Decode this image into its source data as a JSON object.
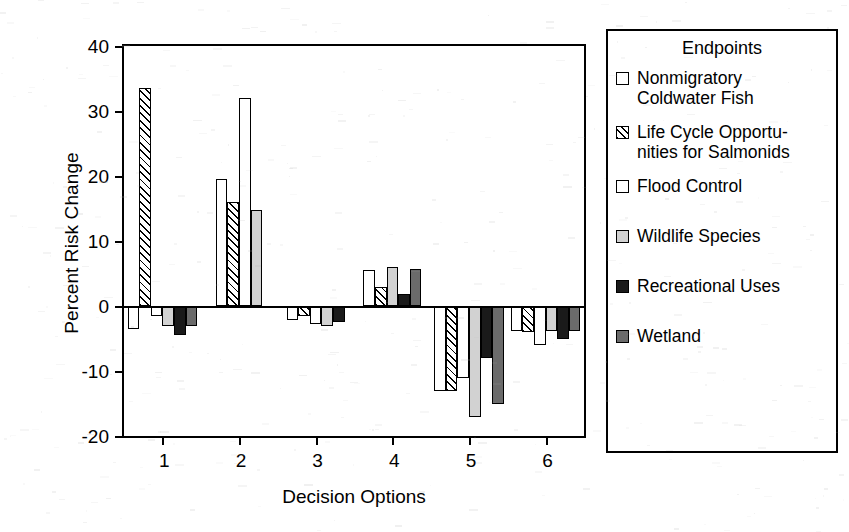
{
  "chart_data": {
    "type": "bar",
    "title": "",
    "xlabel": "Decision Options",
    "ylabel": "Percent Risk Change",
    "categories": [
      "1",
      "2",
      "3",
      "4",
      "5",
      "6"
    ],
    "ylim": [
      -20,
      40
    ],
    "yticks": [
      40,
      30,
      20,
      10,
      0,
      -10,
      -20
    ],
    "ytick_labels": [
      "40",
      "30",
      "20",
      "10",
      "0",
      "-10",
      "-20"
    ],
    "grid": false,
    "legend_position": "right-outside",
    "legend_title": "Endpoints",
    "series": [
      {
        "name": "Nonmigratory Coldwater Fish",
        "label_lines": "Nonmigratory\nColdwater Fish",
        "fill": "white",
        "color": "#ffffff",
        "values": [
          -3.5,
          19.5,
          -2.2,
          5.5,
          -13.0,
          -3.8
        ]
      },
      {
        "name": "Life Cycle Opportunities for Salmonids",
        "label_lines": "Life Cycle Opportu-\nnities for Salmonids",
        "fill": "hatch",
        "color": "#ffffff",
        "values": [
          33.5,
          16.0,
          -1.5,
          3.0,
          -13.0,
          -4.0
        ]
      },
      {
        "name": "Flood Control",
        "label_lines": "Flood Control",
        "fill": "white",
        "color": "#ffffff",
        "values": [
          -1.5,
          32.0,
          -2.8,
          null,
          -11.0,
          -6.0
        ]
      },
      {
        "name": "Wildlife Species",
        "label_lines": "Wildlife Species",
        "fill": "lightgray",
        "color": "#d2d2d2",
        "values": [
          -3.0,
          14.7,
          -3.0,
          6.0,
          -17.0,
          -3.8
        ]
      },
      {
        "name": "Recreational Uses",
        "label_lines": "Recreational Uses",
        "fill": "black",
        "color": "#1a1a1a",
        "values": [
          -4.5,
          null,
          -2.5,
          1.8,
          -8.0,
          -5.0
        ]
      },
      {
        "name": "Wetland",
        "label_lines": "Wetland",
        "fill": "darkgray",
        "color": "#6b6b6b",
        "values": [
          -3.0,
          null,
          null,
          5.7,
          -15.0,
          -3.8
        ]
      }
    ]
  },
  "axes": {
    "ylabel": "Percent Risk Change",
    "xlabel": "Decision Options"
  },
  "legend": {
    "title": "Endpoints"
  }
}
